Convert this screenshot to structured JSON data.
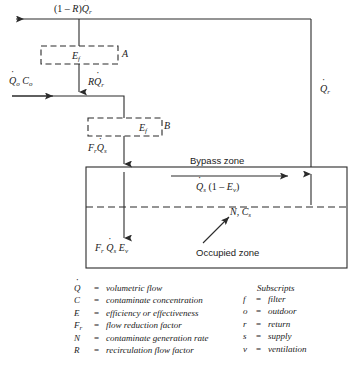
{
  "diagram": {
    "line_color": "#2b2b2b",
    "dashed_color": "#2b2b2b",
    "flow_labels": {
      "return_exhaust": "(1 – R)Q",
      "return_exhaust_sub": "r",
      "outdoor_flow": "Q",
      "outdoor_flow_sub": "o",
      "outdoor_conc": "C",
      "outdoor_conc_sub": "o",
      "recirculated": "RQ",
      "recirculated_sub": "r",
      "return_riser": "Q",
      "return_riser_sub": "r",
      "supply": "F",
      "supply_sub1": "r",
      "supply2": "Q",
      "supply_sub2": "s",
      "bypass": "Q",
      "bypass_sub": "s",
      "bypass_expr": "(1 – E",
      "bypass_expr_sub": "v",
      "bypass_expr_end": ")",
      "occupied_supply_f": "F",
      "occupied_supply_f_sub": "r",
      "occupied_supply_q": "Q",
      "occupied_supply_q_sub": "s",
      "occupied_supply_e": "E",
      "occupied_supply_e_sub": "v",
      "generation_n": "N",
      "generation_comma": ",",
      "generation_c": "C",
      "generation_c_sub": "s"
    },
    "filter_boxes": [
      {
        "symbol": "E",
        "sub": "f",
        "tag": "A"
      },
      {
        "symbol": "E",
        "sub": "f",
        "tag": "B"
      }
    ],
    "zones": [
      {
        "label": "Bypass zone"
      },
      {
        "label": "Occupied zone"
      }
    ]
  },
  "legend": {
    "left": [
      {
        "symbol": "Q",
        "dotted": true,
        "eq": "=",
        "definition": "volumetric flow"
      },
      {
        "symbol": "C",
        "dotted": false,
        "eq": "=",
        "definition": "contaminate concentration"
      },
      {
        "symbol": "E",
        "dotted": false,
        "eq": "=",
        "definition": "efficiency or effectiveness"
      },
      {
        "symbol": "F",
        "sub": "r",
        "dotted": false,
        "eq": "=",
        "definition": "flow reduction factor"
      },
      {
        "symbol": "N",
        "dotted": false,
        "eq": "=",
        "definition": "contaminate generation rate"
      },
      {
        "symbol": "R",
        "dotted": false,
        "eq": "=",
        "definition": "recirculation flow factor"
      }
    ],
    "right_title": "Subscripts",
    "right": [
      {
        "symbol": "f",
        "eq": "=",
        "definition": "filter"
      },
      {
        "symbol": "o",
        "eq": "=",
        "definition": "outdoor"
      },
      {
        "symbol": "r",
        "eq": "=",
        "definition": "return"
      },
      {
        "symbol": "s",
        "eq": "=",
        "definition": "supply"
      },
      {
        "symbol": "v",
        "eq": "=",
        "definition": "ventilation"
      }
    ]
  }
}
